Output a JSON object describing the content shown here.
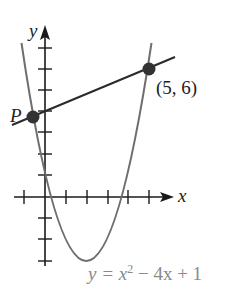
{
  "figure": {
    "type": "function-graph",
    "x_axis_label": "x",
    "y_axis_label": "y",
    "curve_label_prefix": "y = x",
    "curve_label_exponent": "2",
    "curve_label_suffix": " − 4x + 1",
    "curve_equation": "y = x^2 - 4x + 1",
    "point_p_label": "P",
    "point_q_label": "(5, 6)",
    "points": [
      {
        "name": "P",
        "x": -0.6,
        "y": 3.76
      },
      {
        "name": "Q",
        "x": 5,
        "y": 6
      }
    ],
    "secant_line": {
      "through": [
        "P",
        "(5, 6)"
      ]
    },
    "x_ticks": [
      -1,
      1,
      2,
      3,
      4,
      5
    ],
    "y_ticks": [
      -3,
      -2,
      -1,
      1,
      2,
      3,
      4,
      5,
      6,
      7
    ],
    "colors": {
      "axes": "#1a1a1a",
      "curve": "#6e6e6e",
      "line": "#2a2a2a",
      "points": "#333333",
      "label_text": "#222222",
      "equation_text": "#8a8a8a"
    }
  }
}
